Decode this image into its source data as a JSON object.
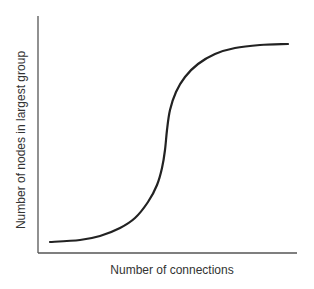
{
  "chart_data": {
    "type": "line",
    "title": "",
    "xlabel": "Number of connections",
    "ylabel": "Number of nodes in largest group",
    "grid": false,
    "legend": null,
    "ticks": {
      "x": [],
      "y": []
    },
    "series": [
      {
        "name": "largest group size",
        "shape": "sigmoid (S-curve)",
        "points_px": [
          [
            50,
            242
          ],
          [
            80,
            240
          ],
          [
            100,
            236
          ],
          [
            120,
            228
          ],
          [
            135,
            218
          ],
          [
            148,
            202
          ],
          [
            157,
            185
          ],
          [
            162,
            168
          ],
          [
            165,
            150
          ],
          [
            167,
            130
          ],
          [
            170,
            110
          ],
          [
            176,
            92
          ],
          [
            185,
            77
          ],
          [
            198,
            64
          ],
          [
            215,
            54
          ],
          [
            235,
            48
          ],
          [
            260,
            45
          ],
          [
            288,
            44
          ]
        ],
        "normalized": {
          "x": [
            0.0,
            0.125,
            0.208,
            0.292,
            0.354,
            0.408,
            0.446,
            0.467,
            0.479,
            0.488,
            0.5,
            0.525,
            0.563,
            0.617,
            0.688,
            0.771,
            0.875,
            0.992
          ],
          "y": [
            0.05,
            0.058,
            0.074,
            0.107,
            0.149,
            0.215,
            0.285,
            0.355,
            0.429,
            0.512,
            0.594,
            0.669,
            0.731,
            0.785,
            0.826,
            0.851,
            0.864,
            0.868
          ]
        }
      }
    ],
    "axes": {
      "origin_px": [
        38,
        253
      ],
      "y_top_px": 16,
      "x_end_px": 297
    },
    "colors": {
      "axis": "#555555",
      "curve": "#222222",
      "text": "#333333"
    }
  }
}
